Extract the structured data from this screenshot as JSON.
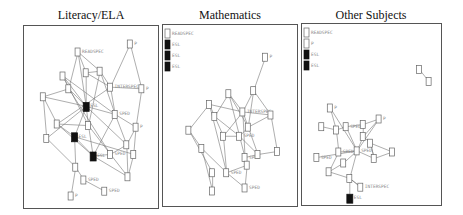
{
  "panels": [
    {
      "title": "Literacy/ELA",
      "legend": [],
      "nodes": [
        {
          "id": "a",
          "label": "READSPEC",
          "x": 0.38,
          "y": 0.1,
          "dark": false
        },
        {
          "id": "b",
          "label": "P",
          "x": 0.83,
          "y": 0.05,
          "dark": false
        },
        {
          "id": "c",
          "label": "",
          "x": 0.25,
          "y": 0.25,
          "dark": false
        },
        {
          "id": "d",
          "label": "",
          "x": 0.45,
          "y": 0.23,
          "dark": false
        },
        {
          "id": "e",
          "label": "",
          "x": 0.57,
          "y": 0.22,
          "dark": false
        },
        {
          "id": "f",
          "label": "INTERSPEC",
          "x": 0.66,
          "y": 0.32,
          "dark": false
        },
        {
          "id": "g",
          "label": "P",
          "x": 0.93,
          "y": 0.33,
          "dark": false
        },
        {
          "id": "h",
          "label": "",
          "x": 0.3,
          "y": 0.33,
          "dark": false
        },
        {
          "id": "i",
          "label": "",
          "x": 0.08,
          "y": 0.38,
          "dark": false
        },
        {
          "id": "j",
          "label": "ESL",
          "x": 0.45,
          "y": 0.44,
          "dark": true
        },
        {
          "id": "k",
          "label": "SPED",
          "x": 0.7,
          "y": 0.49,
          "dark": false
        },
        {
          "id": "l",
          "label": "",
          "x": 0.2,
          "y": 0.55,
          "dark": false
        },
        {
          "id": "m",
          "label": "",
          "x": 0.47,
          "y": 0.56,
          "dark": false
        },
        {
          "id": "n",
          "label": "P",
          "x": 0.88,
          "y": 0.57,
          "dark": false
        },
        {
          "id": "o",
          "label": "ESL",
          "x": 0.35,
          "y": 0.63,
          "dark": true
        },
        {
          "id": "p",
          "label": "",
          "x": 0.11,
          "y": 0.64,
          "dark": false
        },
        {
          "id": "q",
          "label": "",
          "x": 0.8,
          "y": 0.68,
          "dark": false
        },
        {
          "id": "r",
          "label": "SPED",
          "x": 0.66,
          "y": 0.74,
          "dark": false
        },
        {
          "id": "s",
          "label": "",
          "x": 0.86,
          "y": 0.74,
          "dark": false
        },
        {
          "id": "t",
          "label": "ESL",
          "x": 0.51,
          "y": 0.75,
          "dark": true
        },
        {
          "id": "u",
          "label": "",
          "x": 0.36,
          "y": 0.82,
          "dark": false
        },
        {
          "id": "v",
          "label": "SPED",
          "x": 0.43,
          "y": 0.9,
          "dark": false
        },
        {
          "id": "w",
          "label": "",
          "x": 0.81,
          "y": 0.88,
          "dark": false
        },
        {
          "id": "x",
          "label": "P",
          "x": 0.32,
          "y": 1.0,
          "dark": false
        },
        {
          "id": "y",
          "label": "SPED",
          "x": 0.61,
          "y": 0.97,
          "dark": false
        }
      ],
      "edges": [
        [
          "a",
          "d"
        ],
        [
          "a",
          "e"
        ],
        [
          "a",
          "j"
        ],
        [
          "a",
          "h"
        ],
        [
          "b",
          "f"
        ],
        [
          "b",
          "g"
        ],
        [
          "c",
          "h"
        ],
        [
          "c",
          "j"
        ],
        [
          "c",
          "m"
        ],
        [
          "d",
          "e"
        ],
        [
          "d",
          "f"
        ],
        [
          "d",
          "j"
        ],
        [
          "e",
          "f"
        ],
        [
          "e",
          "k"
        ],
        [
          "e",
          "m"
        ],
        [
          "f",
          "g"
        ],
        [
          "f",
          "k"
        ],
        [
          "f",
          "l"
        ],
        [
          "g",
          "n"
        ],
        [
          "h",
          "i"
        ],
        [
          "h",
          "j"
        ],
        [
          "h",
          "r"
        ],
        [
          "i",
          "l"
        ],
        [
          "i",
          "p"
        ],
        [
          "i",
          "j"
        ],
        [
          "j",
          "k"
        ],
        [
          "j",
          "m"
        ],
        [
          "j",
          "q"
        ],
        [
          "j",
          "o"
        ],
        [
          "k",
          "n"
        ],
        [
          "k",
          "q"
        ],
        [
          "l",
          "m"
        ],
        [
          "l",
          "o"
        ],
        [
          "l",
          "t"
        ],
        [
          "m",
          "t"
        ],
        [
          "m",
          "r"
        ],
        [
          "n",
          "q"
        ],
        [
          "n",
          "s"
        ],
        [
          "o",
          "t"
        ],
        [
          "o",
          "u"
        ],
        [
          "o",
          "s"
        ],
        [
          "p",
          "u"
        ],
        [
          "p",
          "j"
        ],
        [
          "q",
          "r"
        ],
        [
          "q",
          "w"
        ],
        [
          "r",
          "t"
        ],
        [
          "r",
          "w"
        ],
        [
          "t",
          "w"
        ],
        [
          "u",
          "v"
        ],
        [
          "u",
          "x"
        ],
        [
          "v",
          "y"
        ],
        [
          "s",
          "w"
        ],
        [
          "k",
          "t"
        ],
        [
          "c",
          "k"
        ]
      ]
    },
    {
      "title": "Mathematics",
      "legend": [
        {
          "label": "READSPEC",
          "dark": false
        },
        {
          "label": "ESL",
          "dark": true
        },
        {
          "label": "ESL",
          "dark": true
        },
        {
          "label": "ESL",
          "dark": true
        }
      ],
      "nodes": [
        {
          "id": "a",
          "label": "P",
          "x": 0.82,
          "y": 0.12,
          "dark": false
        },
        {
          "id": "b",
          "label": "",
          "x": 0.71,
          "y": 0.34,
          "dark": false
        },
        {
          "id": "c",
          "label": "",
          "x": 0.48,
          "y": 0.36,
          "dark": false
        },
        {
          "id": "d",
          "label": "",
          "x": 0.3,
          "y": 0.43,
          "dark": false
        },
        {
          "id": "e",
          "label": "INTERSPEC",
          "x": 0.61,
          "y": 0.48,
          "dark": false
        },
        {
          "id": "f",
          "label": "",
          "x": 0.35,
          "y": 0.51,
          "dark": false
        },
        {
          "id": "g",
          "label": "",
          "x": 0.87,
          "y": 0.5,
          "dark": false
        },
        {
          "id": "h",
          "label": "",
          "x": 0.11,
          "y": 0.6,
          "dark": false
        },
        {
          "id": "i",
          "label": "",
          "x": 0.66,
          "y": 0.58,
          "dark": false
        },
        {
          "id": "j",
          "label": "",
          "x": 0.43,
          "y": 0.64,
          "dark": false
        },
        {
          "id": "k",
          "label": "SPED",
          "x": 0.58,
          "y": 0.64,
          "dark": false
        },
        {
          "id": "l",
          "label": "",
          "x": 0.23,
          "y": 0.72,
          "dark": false
        },
        {
          "id": "m",
          "label": "",
          "x": 0.93,
          "y": 0.74,
          "dark": false
        },
        {
          "id": "n",
          "label": "SPED",
          "x": 0.63,
          "y": 0.78,
          "dark": false
        },
        {
          "id": "o",
          "label": "",
          "x": 0.75,
          "y": 0.76,
          "dark": false
        },
        {
          "id": "p",
          "label": "",
          "x": 0.65,
          "y": 0.83,
          "dark": false
        },
        {
          "id": "q",
          "label": "",
          "x": 0.33,
          "y": 0.88,
          "dark": false
        },
        {
          "id": "r",
          "label": "SPED",
          "x": 0.46,
          "y": 0.88,
          "dark": false
        },
        {
          "id": "s",
          "label": "",
          "x": 0.33,
          "y": 1.0,
          "dark": false
        },
        {
          "id": "t",
          "label": "SPED",
          "x": 0.63,
          "y": 0.98,
          "dark": false
        }
      ],
      "edges": [
        [
          "a",
          "b"
        ],
        [
          "b",
          "e"
        ],
        [
          "b",
          "g"
        ],
        [
          "b",
          "i"
        ],
        [
          "c",
          "e"
        ],
        [
          "c",
          "f"
        ],
        [
          "c",
          "k"
        ],
        [
          "d",
          "e"
        ],
        [
          "d",
          "f"
        ],
        [
          "d",
          "h"
        ],
        [
          "e",
          "g"
        ],
        [
          "e",
          "i"
        ],
        [
          "e",
          "j"
        ],
        [
          "e",
          "n"
        ],
        [
          "f",
          "j"
        ],
        [
          "f",
          "k"
        ],
        [
          "g",
          "i"
        ],
        [
          "g",
          "m"
        ],
        [
          "h",
          "l"
        ],
        [
          "h",
          "q"
        ],
        [
          "i",
          "k"
        ],
        [
          "i",
          "o"
        ],
        [
          "j",
          "k"
        ],
        [
          "j",
          "r"
        ],
        [
          "k",
          "n"
        ],
        [
          "k",
          "o"
        ],
        [
          "l",
          "r"
        ],
        [
          "l",
          "s"
        ],
        [
          "n",
          "o"
        ],
        [
          "n",
          "p"
        ],
        [
          "o",
          "m"
        ],
        [
          "p",
          "r"
        ],
        [
          "p",
          "t"
        ],
        [
          "q",
          "s"
        ],
        [
          "r",
          "t"
        ],
        [
          "d",
          "r"
        ],
        [
          "c",
          "i"
        ]
      ]
    },
    {
      "title": "Other Subjects",
      "legend": [
        {
          "label": "READSPEC",
          "dark": false
        },
        {
          "label": "P",
          "dark": false
        },
        {
          "label": "ESL",
          "dark": true
        },
        {
          "label": "ESL",
          "dark": true
        }
      ],
      "nodes": [
        {
          "id": "a",
          "label": "",
          "x": 0.88,
          "y": 0.05,
          "dark": false
        },
        {
          "id": "b",
          "label": "",
          "x": 0.96,
          "y": 0.16,
          "dark": false
        },
        {
          "id": "c",
          "label": "P",
          "x": 0.15,
          "y": 0.4,
          "dark": false
        },
        {
          "id": "d",
          "label": "P",
          "x": 0.55,
          "y": 0.5,
          "dark": false
        },
        {
          "id": "e",
          "label": "",
          "x": 0.42,
          "y": 0.55,
          "dark": false
        },
        {
          "id": "f",
          "label": "",
          "x": 0.08,
          "y": 0.57,
          "dark": false
        },
        {
          "id": "g",
          "label": "SPED",
          "x": 0.28,
          "y": 0.57,
          "dark": false
        },
        {
          "id": "h",
          "label": "",
          "x": 0.2,
          "y": 0.6,
          "dark": false
        },
        {
          "id": "i",
          "label": "",
          "x": 0.42,
          "y": 0.66,
          "dark": false
        },
        {
          "id": "j",
          "label": "",
          "x": 0.48,
          "y": 0.72,
          "dark": false
        },
        {
          "id": "k",
          "label": "SPED",
          "x": 0.22,
          "y": 0.8,
          "dark": false
        },
        {
          "id": "l",
          "label": "SPED",
          "x": 0.37,
          "y": 0.79,
          "dark": false
        },
        {
          "id": "m",
          "label": "SPED",
          "x": 0.04,
          "y": 0.85,
          "dark": false
        },
        {
          "id": "n",
          "label": "",
          "x": 0.66,
          "y": 0.8,
          "dark": false
        },
        {
          "id": "o",
          "label": "",
          "x": 0.51,
          "y": 0.86,
          "dark": false
        },
        {
          "id": "p",
          "label": "",
          "x": 0.26,
          "y": 0.9,
          "dark": false
        },
        {
          "id": "q",
          "label": "",
          "x": 0.14,
          "y": 0.98,
          "dark": false
        },
        {
          "id": "r",
          "label": "",
          "x": 0.31,
          "y": 1.04,
          "dark": false
        },
        {
          "id": "s",
          "label": "INTERSPEC",
          "x": 0.4,
          "y": 1.12,
          "dark": false
        },
        {
          "id": "t",
          "label": "ESL",
          "x": 0.31,
          "y": 1.22,
          "dark": true
        }
      ],
      "edges": [
        [
          "a",
          "b"
        ],
        [
          "c",
          "h"
        ],
        [
          "c",
          "l"
        ],
        [
          "d",
          "e"
        ],
        [
          "d",
          "i"
        ],
        [
          "e",
          "g"
        ],
        [
          "e",
          "i"
        ],
        [
          "f",
          "h"
        ],
        [
          "g",
          "h"
        ],
        [
          "g",
          "l"
        ],
        [
          "h",
          "k"
        ],
        [
          "i",
          "j"
        ],
        [
          "i",
          "l"
        ],
        [
          "j",
          "n"
        ],
        [
          "j",
          "o"
        ],
        [
          "k",
          "l"
        ],
        [
          "k",
          "q"
        ],
        [
          "l",
          "m"
        ],
        [
          "l",
          "o"
        ],
        [
          "l",
          "p"
        ],
        [
          "l",
          "r"
        ],
        [
          "n",
          "o"
        ],
        [
          "o",
          "j"
        ],
        [
          "p",
          "q"
        ],
        [
          "q",
          "r"
        ],
        [
          "r",
          "s"
        ],
        [
          "r",
          "t"
        ],
        [
          "s",
          "r"
        ],
        [
          "d",
          "l"
        ]
      ]
    }
  ]
}
